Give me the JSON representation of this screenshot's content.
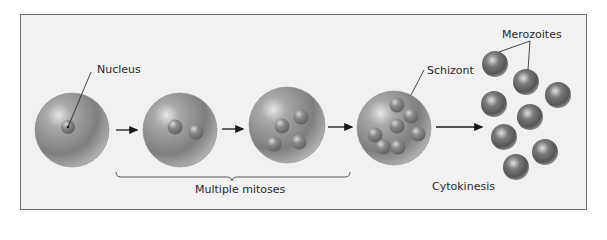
{
  "diagram": {
    "type": "process-flow",
    "labels": {
      "nucleus": "Nucleus",
      "schizont": "Schizont",
      "merozoites": "Merozoites",
      "multiple_mitoses": "Multiple mitoses",
      "cytokinesis": "Cytokinesis"
    },
    "stages": [
      {
        "id": "stage-1",
        "nuclei": 1,
        "label": "Nucleus"
      },
      {
        "id": "stage-2",
        "nuclei": 2
      },
      {
        "id": "stage-3",
        "nuclei": 4
      },
      {
        "id": "stage-4",
        "nuclei": 8,
        "label": "Schizont"
      },
      {
        "id": "stage-5",
        "cells": 9,
        "label": "Merozoites"
      }
    ],
    "colors": {
      "frame_bg": "#f1f1f1",
      "frame_border": "#6e6e6e",
      "cell_fill": "#9a9a9a",
      "nucleus_fill": "#7f7f7f",
      "arrow": "#1a1a1a"
    }
  }
}
